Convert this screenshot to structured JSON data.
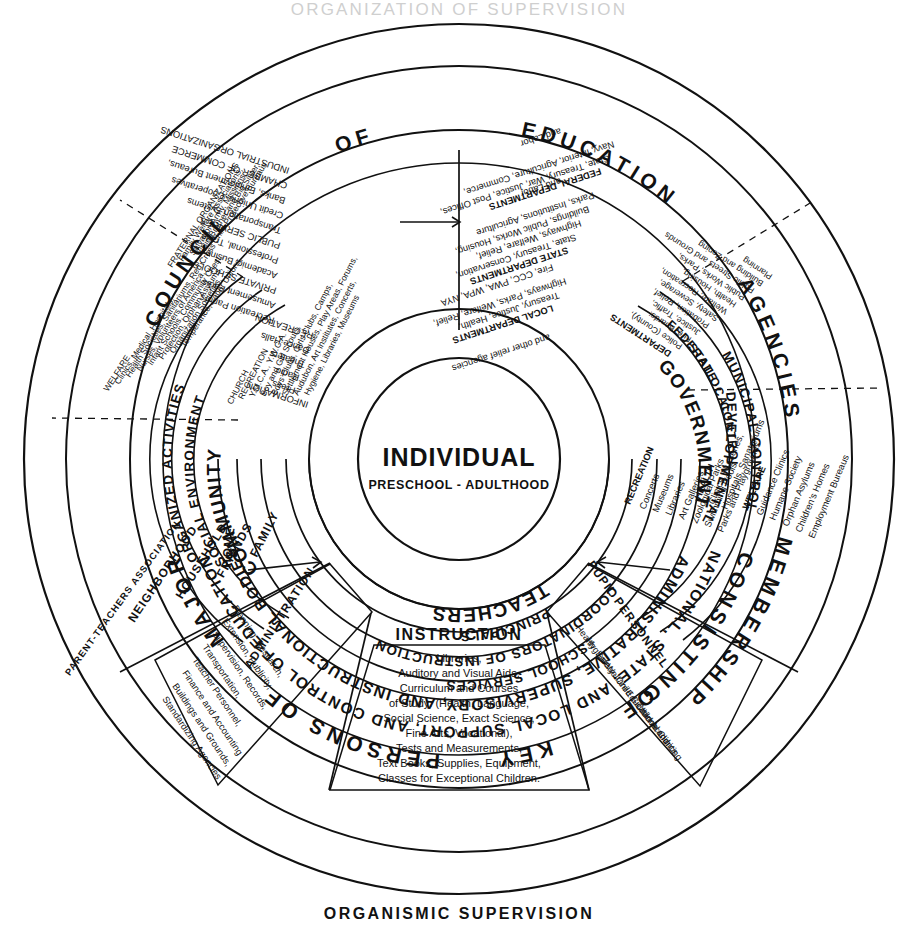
{
  "page": {
    "top_title_cropped": "ORGANIZATION OF SUPERVISION",
    "footer_title": "ORGANISMIC SUPERVISION"
  },
  "outer_ring": {
    "top_arc": [
      "COUNCIL",
      "OF",
      "EDUCATION"
    ],
    "left_arc": "MEMBERSHIP",
    "right_arc": "AGENCIES",
    "bottom_arc": [
      "CONSISTING",
      "OF",
      "KEY",
      "PERSONS",
      "OF",
      "MAJOR"
    ]
  },
  "second_ring": {
    "bottom_line1": "NATIONAL, STATE, AND LOCAL SUPPORT, AND CONTROL OF EDUCATION",
    "bottom_line2": "ADMINISTRATIVE, SUPERVISORY, AND INSTRUCTIONAL BODIES"
  },
  "core": {
    "title": "INDIVIDUAL",
    "subtitle": "PRESCHOOL - ADULTHOOD"
  },
  "inner_ring_sectors": [
    {
      "name": "community-sector",
      "label": "COMMUNITY"
    },
    {
      "name": "government-sector",
      "label": "GOVERNMENT"
    },
    {
      "name": "teachers-sector",
      "label": "TEACHERS"
    }
  ],
  "school_rings": [
    {
      "name": "principals",
      "label": "PRINCIPALS"
    },
    {
      "name": "coordinators",
      "label": "COORDINATORS OF INSTRUCTION"
    },
    {
      "name": "school-services",
      "label": "SCHOOL SERVICES"
    }
  ],
  "school_divisions": [
    {
      "name": "administration",
      "label": "ADMINISTRATION"
    },
    {
      "name": "instruction",
      "label": "INSTRUCTION"
    },
    {
      "name": "pupil-personnel",
      "label": "PUPIL PERSONNEL"
    }
  ],
  "school_details": {
    "administration": [
      "Planning, Research,",
      "Extension, Publicity,",
      "Supervision, Records,",
      "Transportation,",
      "Teacher Personnel,",
      "Finance and Accounting",
      "Buildings and Grounds,",
      "Standardizing Agencies"
    ],
    "instruction": [
      "Libraries,",
      "Auditory and Visual Aids,",
      "Curriculum and Courses",
      "of Study: (Health, Language,",
      "Social Science, Exact Science,",
      "Fine Arts, Vocational),",
      "Tests and Measurements,",
      "Text Books, Supplies, Equipment,",
      "Classes for Exceptional Children."
    ],
    "pupil_personnel": [
      "Health",
      "Hygiene",
      "Safety",
      "Welfare",
      "Child Guidance and",
      "Educational Clinics",
      "Child Accounting"
    ]
  },
  "community_ring2": {
    "social_environment": "SOCIAL ENVIRONMENT",
    "organized_activities": "ORGANIZED ACTIVITIES",
    "home": "HOME"
  },
  "community_ring3": [
    {
      "name": "business-enterprises",
      "label": "BUSINESS ENTERPRISES"
    },
    {
      "name": "church-recreation",
      "label": "CHURCH RECREATION"
    },
    {
      "name": "family",
      "label": "FAMILY"
    },
    {
      "name": "friends",
      "label": "FRIENDS"
    },
    {
      "name": "household",
      "label": "HOUSEHOLD"
    },
    {
      "name": "neighborhood",
      "label": "NEIGHBORHOOD"
    },
    {
      "name": "parent-teachers-association",
      "label": "PARENT-TEACHERS ASSOCIATION"
    }
  ],
  "community_details": {
    "business_enterprises": [
      "INDUSTRIAL ORGANIZATIONS",
      "CHAMBER OF COMMERCE",
      "Banks, Employment Bureaus,",
      "Credit Unions, Cooperatives",
      "Transportation Systems",
      "PUBLIC SERVICES",
      "Professional, Trade",
      "Academic, Business",
      "PRIVATE SCHOOLS",
      "Amusement Parks",
      "Recreation Parlors",
      "RECREATION",
      "Dance Halls",
      "Theaters",
      "Radio",
      "Press",
      "INFORMATION"
    ],
    "church_recreation": [
      "CHURCH",
      "RECREATION",
      "Y.M.C.A., Y.W.C.A.",
      "Boy and Girl Scouts,",
      "Boys Clubs, Girls Clubs, Camps,",
      "Settlement Houses, Play Areas, Forums,",
      "Audubon, Art Institutes, Concerts,",
      "Hygiene, Libraries, Museums"
    ],
    "welfare_fraternal": [
      "WELFARE",
      "Clinics, Medical, Hospitals,",
      "Health Societies, Sanitariums, Red Cross",
      "Nurses, Volunteers of America,",
      "Infant Schools, Community Chest,",
      "Protection, Orphan Asylums,",
      "Organization Societies,",
      "Temperance, Labor Unions,",
      "FRATERNAL ORGANIZATIONS",
      "Family Welfare Associations,",
      "Salvation Army, Missions,",
      "Big Brother and Big Sister,",
      "Child Protective Bureaus"
    ]
  },
  "government_ring2": [
    {
      "name": "federal-control",
      "label": "FEDERAL"
    },
    {
      "name": "state-control",
      "label": "STATE"
    },
    {
      "name": "local-control",
      "label": "LOCAL"
    },
    {
      "name": "control",
      "label": "CONTROL"
    },
    {
      "name": "municipal-control",
      "label": "MUNICIPAL CONTROL"
    },
    {
      "name": "developmental",
      "label": "DEVELOPMENTAL"
    }
  ],
  "government_details": {
    "federal_departments": {
      "heading": "FEDERAL DEPARTMENTS",
      "items": [
        "State, Treasury, War, Justice, Post Offices,",
        "Navy, Interior, Agriculture, Commerce,",
        "and Labor"
      ]
    },
    "state_departments": {
      "heading": "STATE DEPARTMENTS",
      "items": [
        "State, Treasury, Conservation,",
        "Highways, Welfare, Relief,",
        "Buildings, Public Works, Housing,",
        "Parks, Institutions, Agriculture",
        "and Labor"
      ]
    },
    "local_departments": {
      "heading": "LOCAL DEPARTMENTS",
      "items": [
        "Treasury, Justice, Health,",
        "Highways, Parks, Welfare, Relief,",
        "Fire, CCC, PWA, WPA, NYA",
        "and other relief agencies"
      ]
    },
    "municipal_departments": {
      "heading": "DEPARTMENTS",
      "items": [
        "Police (County),",
        "Fire, Boards:",
        "Justice, Traffic,",
        "Probation, Relief,",
        "Safety, Sewerage,",
        "Welfare, Recreation,",
        "Health, Housing,",
        "Public Works, Parks,",
        "Public Streets and Grounds",
        "Building and Zoning",
        "Planning"
      ]
    },
    "developmental": [
      {
        "heading": "RECREATION",
        "items": [
          "Concerts",
          "Museums",
          "Libraries",
          "Art Galleries",
          "Zoological Parks",
          "Swimming Pools",
          "Parks and Playgrounds"
        ]
      },
      {
        "heading": "HEALTH",
        "items": [
          "Clinics, Nurseries,",
          "Hospitals, Sanatoriums"
        ]
      },
      {
        "heading": "WELFARE",
        "items": [
          "Guidance Clinics",
          "Humane Society",
          "Orphan Asylums",
          "Children's Homes",
          "Employment Bureaus"
        ]
      }
    ]
  }
}
